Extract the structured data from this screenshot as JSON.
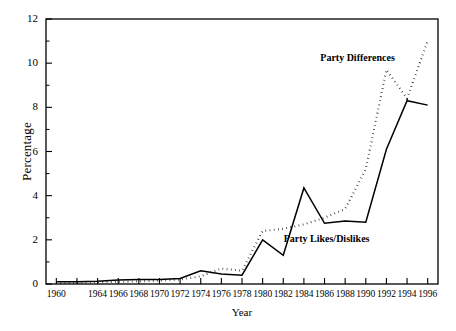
{
  "chart_data": {
    "type": "line",
    "title": "",
    "xlabel": "Year",
    "ylabel": "Percentage",
    "xlim": [
      1959,
      1997
    ],
    "ylim": [
      0,
      12
    ],
    "grid": false,
    "legend_position": "inline-annotations",
    "x": [
      1960,
      1962,
      1964,
      1966,
      1968,
      1970,
      1972,
      1974,
      1976,
      1978,
      1980,
      1982,
      1984,
      1986,
      1988,
      1990,
      1992,
      1994,
      1996
    ],
    "xticks": [
      1960,
      1962,
      1964,
      1966,
      1968,
      1970,
      1972,
      1974,
      1976,
      1978,
      1980,
      1982,
      1984,
      1986,
      1988,
      1990,
      1992,
      1994,
      1996
    ],
    "xtick_labels": [
      "1960",
      "",
      "1964",
      "1966",
      "1968",
      "1970",
      "1972",
      "1974",
      "1976",
      "1978",
      "1980",
      "1982",
      "1984",
      "1986",
      "1988",
      "1990",
      "1992",
      "1994",
      "1996"
    ],
    "yticks": [
      0,
      2,
      4,
      6,
      8,
      10,
      12
    ],
    "ytick_labels": [
      "0",
      "2",
      "4",
      "6",
      "8",
      "10",
      "12"
    ],
    "yminor_ticks": [
      1,
      3,
      5,
      7,
      9,
      11
    ],
    "series": [
      {
        "name": "Party Likes/Dislikes",
        "style": "solid",
        "color": "#000000",
        "values": [
          0.1,
          0.1,
          0.12,
          0.18,
          0.2,
          0.2,
          0.25,
          0.6,
          0.45,
          0.4,
          2.0,
          1.3,
          4.35,
          2.75,
          2.85,
          2.8,
          6.1,
          8.3,
          8.1
        ]
      },
      {
        "name": "Party Differences",
        "style": "dotted",
        "color": "#000000",
        "values": [
          0.05,
          0.05,
          0.08,
          0.1,
          0.12,
          0.15,
          0.2,
          0.35,
          0.7,
          0.6,
          2.4,
          2.5,
          2.7,
          3.0,
          3.4,
          5.2,
          9.7,
          8.4,
          11.0
        ]
      }
    ],
    "annotations": [
      {
        "text": "Party Differences",
        "x": 1989.2,
        "y": 10.25
      },
      {
        "text": "Party Likes/Dislikes",
        "x": 1986.2,
        "y": 2.05
      }
    ]
  }
}
